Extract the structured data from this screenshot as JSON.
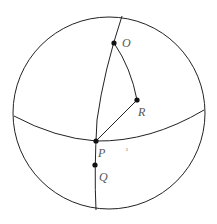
{
  "diagram": {
    "type": "spherical-geometry",
    "colors": {
      "stroke": "#222222",
      "point": "#111111",
      "label": "#555555"
    },
    "sphere": {
      "cx": 109,
      "cy": 113,
      "r": 96
    },
    "points": [
      {
        "id": "O",
        "label": "O",
        "x": 114,
        "y": 43,
        "label_x": 122,
        "label_y": 47
      },
      {
        "id": "R",
        "label": "R",
        "x": 137,
        "y": 100,
        "label_x": 138,
        "label_y": 116
      },
      {
        "id": "P",
        "label": "P",
        "x": 96,
        "y": 141,
        "label_x": 98,
        "label_y": 157
      },
      {
        "id": "Q",
        "label": "Q",
        "x": 95,
        "y": 165,
        "label_x": 99,
        "label_y": 181
      }
    ],
    "tick_mark": {
      "text": "ı",
      "x": 126,
      "y": 151
    }
  }
}
